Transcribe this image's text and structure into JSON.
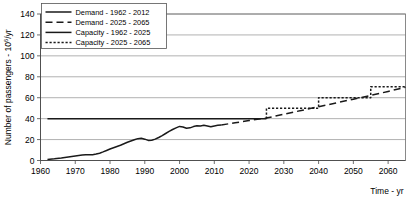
{
  "chart_data": {
    "type": "line",
    "title": "",
    "xlabel": "Time - yr",
    "ylabel": "Number of passengers - 10⁶/yr",
    "ylabel_base": "Number of passengers - 10",
    "ylabel_sup": "6",
    "ylabel_tail": "/yr",
    "xlim": [
      1960,
      2065
    ],
    "ylim": [
      0,
      140
    ],
    "xticks": [
      1960,
      1970,
      1980,
      1990,
      2000,
      2010,
      2020,
      2030,
      2040,
      2050,
      2060
    ],
    "yticks": [
      0,
      20,
      40,
      60,
      80,
      100,
      120,
      140
    ],
    "grid": "horizontal",
    "legend_position": "top-left",
    "series": [
      {
        "name": "Demand - 1962 - 2012",
        "style": "solid",
        "color": "#1a1a1a",
        "x": [
          1962,
          1964,
          1966,
          1968,
          1970,
          1972,
          1973,
          1974,
          1975,
          1976,
          1977,
          1978,
          1979,
          1980,
          1981,
          1982,
          1983,
          1984,
          1985,
          1986,
          1987,
          1988,
          1989,
          1990,
          1991,
          1992,
          1993,
          1994,
          1995,
          1996,
          1997,
          1998,
          1999,
          2000,
          2001,
          2002,
          2003,
          2004,
          2005,
          2006,
          2007,
          2008,
          2009,
          2010,
          2011,
          2012
        ],
        "y": [
          1.0,
          1.6,
          2.4,
          3.4,
          4.3,
          5.2,
          5.6,
          5.4,
          5.6,
          6.2,
          7.0,
          8.2,
          9.6,
          11.0,
          12.2,
          13.4,
          14.6,
          16.0,
          17.4,
          18.6,
          19.8,
          20.9,
          21.2,
          20.4,
          19.2,
          19.4,
          20.4,
          22.0,
          23.8,
          25.8,
          27.8,
          29.6,
          31.2,
          32.6,
          32.0,
          30.8,
          31.2,
          32.4,
          33.2,
          33.0,
          33.6,
          33.0,
          32.2,
          33.0,
          33.6,
          34.0
        ]
      },
      {
        "name": "Demand - 2025 - 2065",
        "style": "dashed",
        "color": "#1a1a1a",
        "x": [
          2012,
          2016,
          2020,
          2025,
          2030,
          2035,
          2040,
          2045,
          2050,
          2055,
          2060,
          2065
        ],
        "y": [
          34.0,
          36.0,
          38.2,
          40.6,
          44.2,
          47.8,
          51.4,
          55.0,
          58.6,
          62.2,
          66.0,
          70.0
        ]
      },
      {
        "name": "Capacity - 1962 - 2025",
        "style": "solid",
        "color": "#1a1a1a",
        "x": [
          1962,
          2025
        ],
        "y": [
          40.0,
          40.0
        ]
      },
      {
        "name": "Capacity - 2025 - 2065",
        "style": "dotted",
        "color": "#1a1a1a",
        "x": [
          2025,
          2025,
          2040,
          2040,
          2055,
          2055,
          2065
        ],
        "y": [
          40.0,
          50.0,
          50.0,
          60.0,
          60.0,
          70.5,
          70.5
        ]
      }
    ],
    "legend_entries": [
      {
        "label": "Demand - 1962 - 2012",
        "style": "solid"
      },
      {
        "label": "Demand - 2025 - 2065",
        "style": "dashed"
      },
      {
        "label": "Capacity - 1962 - 2025",
        "style": "solid"
      },
      {
        "label": "Capacity - 2025 - 2065",
        "style": "dotted"
      }
    ]
  }
}
